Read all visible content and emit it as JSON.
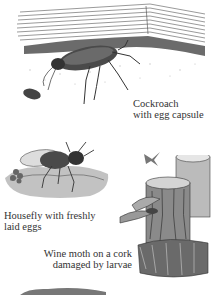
{
  "page": {
    "illustrations": [
      {
        "id": "cockroach",
        "caption_lines": [
          "Cockroach",
          "with egg capsule"
        ]
      },
      {
        "id": "housefly",
        "caption_lines": [
          "Housefly with freshly",
          "laid eggs"
        ]
      },
      {
        "id": "wine-moth",
        "caption_lines": [
          "Wine moth on a cork",
          "damaged by larvae"
        ]
      }
    ],
    "colors": {
      "ink": "#2a2a2a",
      "paper": "#ffffff"
    }
  }
}
